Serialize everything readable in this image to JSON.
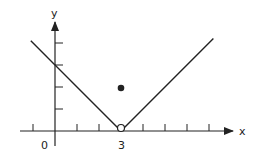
{
  "chart_data": {
    "type": "line",
    "title": "",
    "xlabel": "x",
    "ylabel": "y",
    "x_tick_labels": [
      {
        "value": 0,
        "label": "0"
      },
      {
        "value": 3,
        "label": "3"
      }
    ],
    "x_ticks": [
      -1,
      1,
      2,
      3,
      4,
      5,
      6,
      7
    ],
    "y_ticks": [
      1,
      2,
      3,
      4
    ],
    "xlim": [
      -1.6,
      8.8
    ],
    "ylim": [
      -0.6,
      5.2
    ],
    "grid": false,
    "legend": null,
    "series": [
      {
        "name": "graph",
        "description": "V-shaped graph y = |x - 3| with vertex removed",
        "x": [
          -1.1,
          0,
          3,
          7.2
        ],
        "y": [
          4.1,
          3,
          0,
          4.2
        ]
      }
    ],
    "points": [
      {
        "x": 3,
        "y": 0,
        "style": "open",
        "description": "hole at vertex"
      },
      {
        "x": 3,
        "y": 2,
        "style": "filled",
        "description": "defined value at x=3"
      }
    ],
    "colors": {
      "line": "#222222",
      "axis": "#222222"
    }
  }
}
